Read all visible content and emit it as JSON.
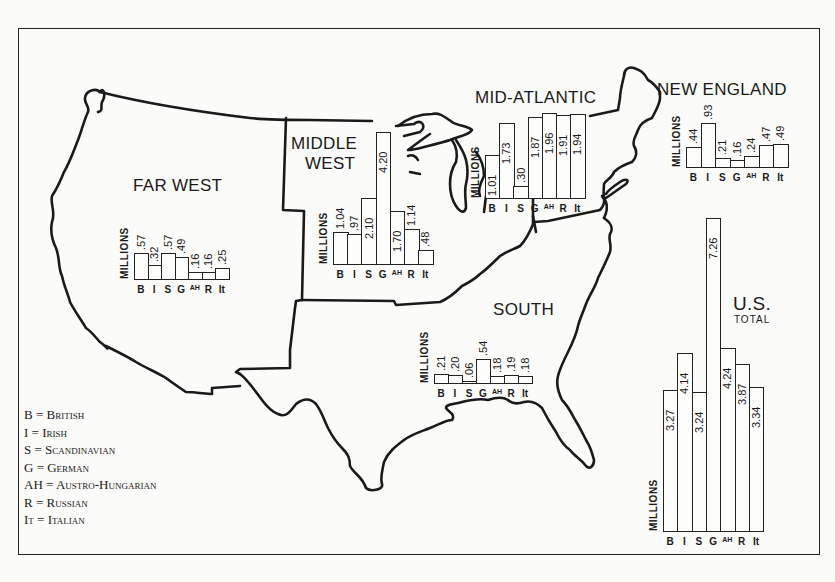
{
  "chart_data": {
    "type": "bar",
    "ylabel": "MILLIONS",
    "categories": [
      "B",
      "I",
      "S",
      "G",
      "AH",
      "R",
      "It"
    ],
    "legend": [
      {
        "code": "B",
        "name": "British"
      },
      {
        "code": "I",
        "name": "Irish"
      },
      {
        "code": "S",
        "name": "Scandinavian"
      },
      {
        "code": "G",
        "name": "German"
      },
      {
        "code": "AH",
        "name": "Austro-Hungarian"
      },
      {
        "code": "R",
        "name": "Russian"
      },
      {
        "code": "It",
        "name": "Italian"
      }
    ],
    "series": [
      {
        "name": "FAR WEST",
        "values": [
          0.57,
          0.32,
          0.57,
          0.49,
          0.16,
          0.16,
          0.25
        ],
        "labels": [
          ".57",
          ".32",
          ".57",
          ".49",
          ".16",
          ".16",
          ".25"
        ]
      },
      {
        "name": "MIDDLE WEST",
        "values": [
          1.04,
          0.97,
          2.1,
          4.2,
          1.7,
          1.14,
          0.48
        ],
        "labels": [
          "1.04",
          ".97",
          "2.10",
          "4.20",
          "1.70",
          "1.14",
          ".48"
        ]
      },
      {
        "name": "MID-ATLANTIC",
        "values": [
          1.01,
          1.73,
          0.3,
          1.87,
          1.96,
          1.91,
          1.94
        ],
        "labels": [
          "1.01",
          "1.73",
          ".30",
          "1.87",
          "1.96",
          "1.91",
          "1.94"
        ]
      },
      {
        "name": "NEW ENGLAND",
        "values": [
          0.44,
          0.93,
          0.21,
          0.16,
          0.24,
          0.47,
          0.49
        ],
        "labels": [
          ".44",
          ".93",
          ".21",
          ".16",
          ".24",
          ".47",
          ".49"
        ]
      },
      {
        "name": "SOUTH",
        "values": [
          0.21,
          0.2,
          0.06,
          0.54,
          0.18,
          0.19,
          0.18
        ],
        "labels": [
          ".21",
          ".20",
          ".06",
          ".54",
          ".18",
          ".19",
          ".18"
        ]
      },
      {
        "name": "U.S. TOTAL",
        "values": [
          3.27,
          4.14,
          3.24,
          7.26,
          4.24,
          3.87,
          3.34
        ],
        "labels": [
          "3.27",
          "4.14",
          "3.24",
          "7.26",
          "4.24",
          "3.87",
          "3.34"
        ]
      }
    ]
  },
  "regions": {
    "far_west": {
      "label": "FAR WEST"
    },
    "middle_west": {
      "label_1": "MIDDLE",
      "label_2": "WEST"
    },
    "mid_atlantic": {
      "label": "MID-ATLANTIC"
    },
    "new_england": {
      "label": "NEW ENGLAND"
    },
    "south": {
      "label": "SOUTH"
    },
    "us_total": {
      "label": "U.S.",
      "sub": "TOTAL"
    }
  },
  "axis_label": "MILLIONS",
  "legend": [
    "B = British",
    "I = Irish",
    "S = Scandinavian",
    "G = German",
    "AH = Austro-Hungarian",
    "R = Russian",
    "It = Italian"
  ],
  "colors": {
    "ink": "#1a1a1a",
    "paper": "#fbfbf9"
  }
}
